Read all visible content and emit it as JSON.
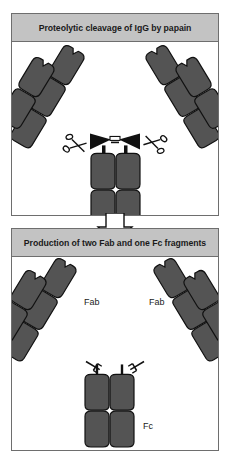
{
  "figure": {
    "title": "Proteolytic cleavage of IgG by papain",
    "background_color": "#ffffff"
  },
  "colors": {
    "domain_fill": "#545454",
    "domain_stroke": "#111111",
    "panel_border": "#6e6e6e",
    "title_bar": "#c3c3c3",
    "hinge_black": "#111111",
    "arrow_fill": "#ffffff",
    "arrow_stroke": "#111111",
    "text": "#1a1a1a"
  },
  "panels": [
    {
      "id": "top",
      "title": "Proteolytic cleavage of IgG by papain",
      "caption_labels": [],
      "icons": [
        {
          "name": "scissors-icon",
          "position": "hinge-left"
        },
        {
          "name": "scissors-icon",
          "position": "hinge-right"
        }
      ]
    },
    {
      "id": "bottom",
      "title": "Production of two Fab and one Fc fragments",
      "caption_labels": [
        {
          "text": "Fab",
          "x": 72,
          "y": 48
        },
        {
          "text": "Fab",
          "x": 137,
          "y": 48
        },
        {
          "text": "Fc",
          "x": 131,
          "y": 173
        }
      ],
      "icons": []
    }
  ],
  "arrow": {
    "name": "down-arrow",
    "direction": "down"
  },
  "molecule": {
    "name": "IgG antibody",
    "chains": [
      "heavy chain",
      "light chain"
    ],
    "fragments": [
      "Fab",
      "Fab",
      "Fc"
    ]
  }
}
